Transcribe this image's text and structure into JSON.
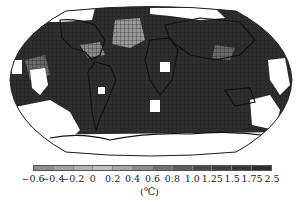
{
  "caption": "",
  "map": {
    "projection": "robinson-like",
    "ocean_color": "#2e2e2e",
    "missing_color": "#ffffff",
    "outline_color": "#111111",
    "light_regions": [
      {
        "name": "north-atlantic-cool",
        "color": "#9a9a9a"
      },
      {
        "name": "central-america-cool",
        "color": "#8a8a8a"
      },
      {
        "name": "east-pacific",
        "color": "#6a6a6a"
      }
    ]
  },
  "colorbar": {
    "colors": [
      "#8e8e8e",
      "#a3a3a3",
      "#b2b2b2",
      "#bdbdbd",
      "#a8a8a8",
      "#8c8c8c",
      "#707070",
      "#5c5c5c",
      "#4a4a4a",
      "#3e3e3e",
      "#343434",
      "#2c2c2c",
      "#262626"
    ],
    "ticks": [
      "-0.6",
      "-0.4",
      "-0.2",
      "0",
      "0.2",
      "0.4",
      "0.6",
      "0.8",
      "1.0",
      "1.25",
      "1.5",
      "1.75",
      "2.5"
    ],
    "unit": "(℃)"
  }
}
